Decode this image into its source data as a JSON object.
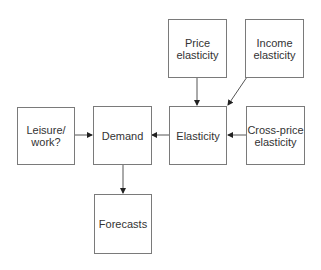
{
  "diagram": {
    "nodes": {
      "price": "Price elasticity",
      "income": "Income elasticity",
      "leisure": "Leisure/ work?",
      "demand": "Demand",
      "elasticity": "Elasticity",
      "cross": "Cross-price elasticity",
      "forecasts": "Forecasts"
    },
    "edges": [
      {
        "from": "Price elasticity",
        "to": "Elasticity"
      },
      {
        "from": "Income elasticity",
        "to": "Elasticity"
      },
      {
        "from": "Cross-price elasticity",
        "to": "Elasticity"
      },
      {
        "from": "Elasticity",
        "to": "Demand"
      },
      {
        "from": "Leisure/ work?",
        "to": "Demand"
      },
      {
        "from": "Demand",
        "to": "Forecasts"
      }
    ]
  }
}
